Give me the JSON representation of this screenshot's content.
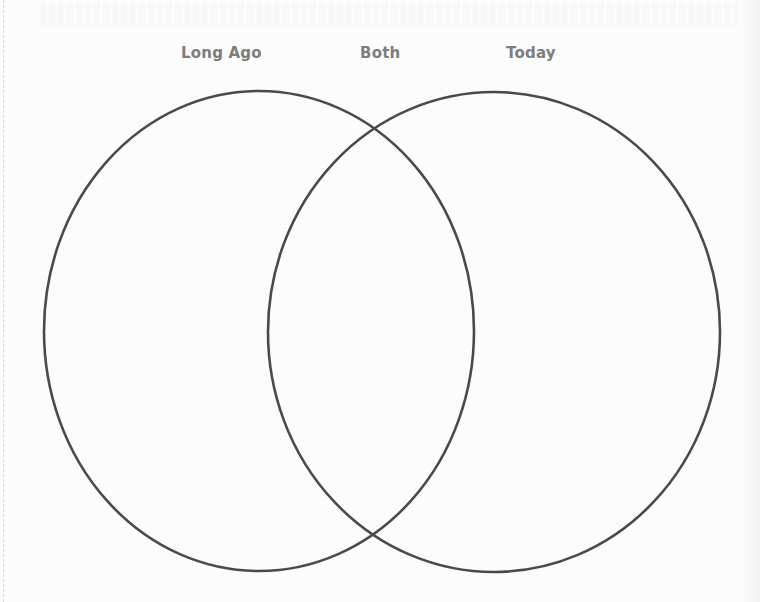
{
  "diagram": {
    "type": "venn",
    "sets": 2,
    "labels": {
      "left": "Long Ago",
      "center": "Both",
      "right": "Today"
    },
    "circles": [
      {
        "name": "left",
        "cx": 259,
        "cy": 331,
        "rx": 215,
        "ry": 240
      },
      {
        "name": "right",
        "cx": 494,
        "cy": 332,
        "rx": 226,
        "ry": 240
      }
    ],
    "colors": {
      "stroke": "#4a4a4a",
      "label": "#7d7d7d",
      "background": "#fcfcfc"
    }
  }
}
